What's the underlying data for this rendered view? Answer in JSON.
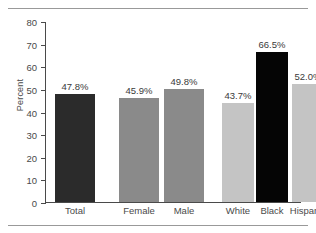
{
  "chart_data": {
    "type": "bar",
    "title": "",
    "xlabel": "",
    "ylabel": "Percent",
    "ylim": [
      0,
      80
    ],
    "yticks": [
      0,
      10,
      20,
      30,
      40,
      50,
      60,
      70,
      80
    ],
    "ytick_labels": [
      "0",
      "10",
      "20",
      "30",
      "40",
      "50",
      "60",
      "70",
      "80"
    ],
    "grid": false,
    "legend": "none",
    "categories": [
      "Total",
      "Female",
      "Male",
      "White",
      "Black",
      "Hispanic"
    ],
    "values": [
      47.8,
      45.9,
      49.8,
      43.7,
      66.5,
      52.0
    ],
    "value_labels": [
      "47.8%",
      "45.9%",
      "49.8%",
      "43.7%",
      "66.5%",
      "52.0%"
    ],
    "bar_colors": [
      "#2b2b2b",
      "#8a8a8a",
      "#8a8a8a",
      "#c4c4c4",
      "#050505",
      "#c4c4c4"
    ],
    "bars": [
      {
        "category": "Total",
        "value": 47.8,
        "label": "47.8%",
        "color": "#2b2b2b",
        "x": 10,
        "width": 40
      },
      {
        "category": "Female",
        "value": 45.9,
        "label": "45.9%",
        "color": "#8a8a8a",
        "x": 74,
        "width": 40
      },
      {
        "category": "Male",
        "value": 49.8,
        "label": "49.8%",
        "color": "#8a8a8a",
        "x": 119,
        "width": 40
      },
      {
        "category": "White",
        "value": 43.7,
        "label": "43.7%",
        "color": "#c4c4c4",
        "x": 177,
        "width": 32
      },
      {
        "category": "Black",
        "value": 66.5,
        "label": "66.5%",
        "color": "#050505",
        "x": 211,
        "width": 32
      },
      {
        "category": "Hispanic",
        "value": 52.0,
        "label": "52.0%",
        "color": "#c4c4c4",
        "x": 247,
        "width": 32
      }
    ]
  },
  "axis": {
    "color": "#4a4a4a"
  },
  "rules": {
    "top_color": "#999999",
    "bottom_color": "#999999"
  }
}
